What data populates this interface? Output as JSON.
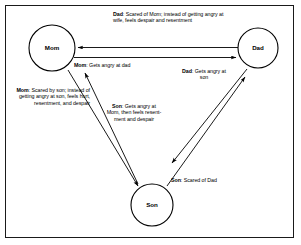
{
  "figure": {
    "type": "cycle-diagram",
    "background_color": "#ffffff",
    "line_color": "#000000",
    "border_color": "#1a1a1a"
  },
  "nodes": [
    {
      "id": "mom",
      "label": "Mom",
      "cx": 52,
      "cy": 48,
      "r": 23
    },
    {
      "id": "dad",
      "label": "Dad",
      "cx": 258,
      "cy": 48,
      "r": 20
    },
    {
      "id": "son",
      "label": "Son",
      "cx": 152,
      "cy": 205,
      "r": 21
    }
  ],
  "edges": [
    {
      "id": "dad-to-mom",
      "from": "Dad",
      "to": "Mom",
      "direction": "left",
      "label_actor": "Dad",
      "label_text": ": Scared of Mom; instead of getting angry at wife, feels despair and resentment"
    },
    {
      "id": "mom-to-dad",
      "from": "Mom",
      "to": "Dad",
      "direction": "right",
      "label_actor": "Mom",
      "label_text": ": Gets angry at dad"
    },
    {
      "id": "dad-to-son",
      "from": "Dad",
      "to": "Son",
      "direction": "down-left",
      "label_actor": "Dad",
      "label_text": ": Gets angry at son"
    },
    {
      "id": "son-to-dad",
      "from": "Son",
      "to": "Dad",
      "direction": "up-right",
      "label_actor": "Son",
      "label_text": ": Scared of Dad"
    },
    {
      "id": "mom-to-son",
      "from": "Mom",
      "to": "Son",
      "direction": "down-right",
      "label_actor": "Mom",
      "label_text": ": Scared by son; instead of getting angry at son, feels hurt, resentment, and despair"
    },
    {
      "id": "son-to-mom",
      "from": "Son",
      "to": "Mom",
      "direction": "up-left",
      "label_actor": "Son",
      "label_text": ": Gets angry at Mom, then feels resent-ment and despair"
    }
  ],
  "labels": {
    "dad_scared": {
      "actor": "Dad",
      "rest": ": Scared of Mom; instead of getting angry at wife, feels despair and resentment"
    },
    "mom_angry": {
      "actor": "Mom",
      "rest": ": Gets angry at dad"
    },
    "dad_angry": {
      "actor": "Dad",
      "rest": ": Gets angry at son"
    },
    "mom_scared": {
      "actor": "Mom",
      "rest": ": Scared by son; instead of getting angry at son, feels hurt, resentment, and despair"
    },
    "son_angry": {
      "actor": "Son",
      "rest": ": Gets angry at Mom, then feels resent-ment and despair"
    },
    "son_scared": {
      "actor": "Son",
      "rest": ": Scared of Dad"
    }
  }
}
